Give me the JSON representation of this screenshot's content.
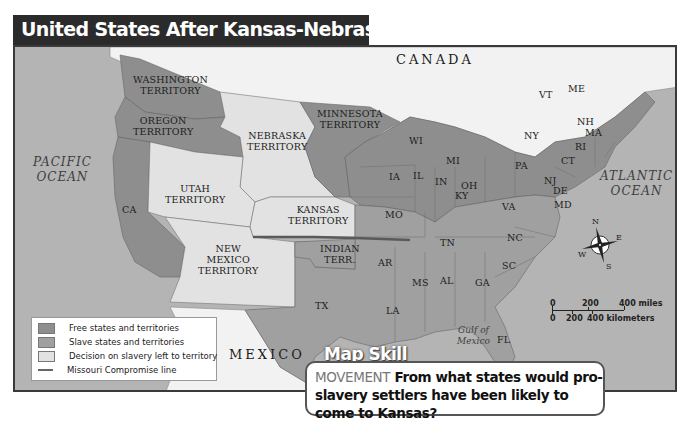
{
  "title": "United States After Kansas-Nebraska Act",
  "colors": {
    "free": "#8e8e8e",
    "slave": "#a0a0a0",
    "decision": "#e2e2e2",
    "foreign_land": "#f2f2f2",
    "water": "#b4b4b4",
    "missouri_line": "#5a5a5a",
    "title_bg": "#2b2b2b"
  },
  "labels": {
    "canada": "CANADA",
    "mexico": "MEXICO",
    "pacific_1": "PACIFIC",
    "pacific_2": "OCEAN",
    "atlantic_1": "ATLANTIC",
    "atlantic_2": "OCEAN",
    "gulf_1": "Gulf of",
    "gulf_2": "Mexico",
    "washington_1": "WASHINGTON",
    "washington_2": "TERRITORY",
    "oregon_1": "OREGON",
    "oregon_2": "TERRITORY",
    "minnesota_1": "MINNESOTA",
    "minnesota_2": "TERRITORY",
    "nebraska_1": "NEBRASKA",
    "nebraska_2": "TERRITORY",
    "utah_1": "UTAH",
    "utah_2": "TERRITORY",
    "kansas_1": "KANSAS",
    "kansas_2": "TERRITORY",
    "newmexico_1": "NEW",
    "newmexico_2": "MEXICO",
    "newmexico_3": "TERRITORY",
    "indian_1": "INDIAN",
    "indian_2": "TERR.",
    "states": {
      "CA": "CA",
      "TX": "TX",
      "IA": "IA",
      "MO": "MO",
      "AR": "AR",
      "LA": "LA",
      "WI": "WI",
      "IL": "IL",
      "MI": "MI",
      "IN": "IN",
      "OH": "OH",
      "KY": "KY",
      "TN": "TN",
      "MS": "MS",
      "AL": "AL",
      "GA": "GA",
      "FL": "FL",
      "SC": "SC",
      "NC": "NC",
      "VA": "VA",
      "PA": "PA",
      "NY": "NY",
      "NJ": "NJ",
      "DE": "DE",
      "MD": "MD",
      "CT": "CT",
      "RI": "RI",
      "MA": "MA",
      "NH": "NH",
      "VT": "VT",
      "ME": "ME"
    }
  },
  "legend": {
    "items": [
      {
        "label": "Free states and territories",
        "type": "free"
      },
      {
        "label": "Slave states and territories",
        "type": "slave"
      },
      {
        "label": "Decision on slavery left to territory",
        "type": "decision"
      },
      {
        "label": "Missouri Compromise line",
        "type": "line"
      }
    ]
  },
  "compass": {
    "n": "N",
    "e": "E",
    "s": "S",
    "w": "W"
  },
  "scale": {
    "miles_ticks": [
      "0",
      "200",
      "400 miles"
    ],
    "km_ticks": [
      "0",
      "200",
      "400 kilometers"
    ]
  },
  "map_skill": {
    "tab": "Map Skill",
    "keyword": "MOVEMENT",
    "question": "From what states would pro-slavery settlers have been likely to come to Kansas?"
  }
}
